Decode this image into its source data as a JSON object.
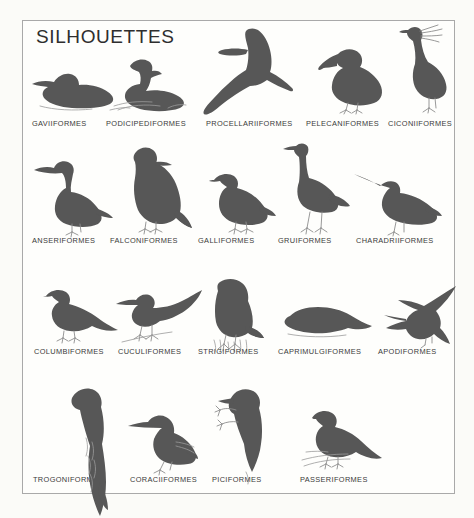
{
  "plate": {
    "title": "SILHOUETTES",
    "border_color": "#a9a9a9",
    "background_color": "#fefefc",
    "silhouette_color": "#575757",
    "label_color": "#3a3a3a"
  },
  "rows": [
    {
      "row_index": 1,
      "items": [
        {
          "label": "GAVIIFORMES",
          "icon": "loon-silhouette",
          "pose": "swimming"
        },
        {
          "label": "PODICIPEDIFORMES",
          "icon": "grebe-silhouette",
          "pose": "swimming-in-water"
        },
        {
          "label": "PROCELLARIIFORMES",
          "icon": "albatross-silhouette",
          "pose": "gliding"
        },
        {
          "label": "PELECANIFORMES",
          "icon": "pelican-silhouette",
          "pose": "standing"
        },
        {
          "label": "CICONIIFORMES",
          "icon": "heron-silhouette",
          "pose": "standing"
        }
      ]
    },
    {
      "row_index": 2,
      "items": [
        {
          "label": "ANSERIFORMES",
          "icon": "goose-silhouette",
          "pose": "standing"
        },
        {
          "label": "FALCONIFORMES",
          "icon": "falcon-silhouette",
          "pose": "perched"
        },
        {
          "label": "GALLIFORMES",
          "icon": "grouse-silhouette",
          "pose": "standing"
        },
        {
          "label": "GRUIFORMES",
          "icon": "crane-silhouette",
          "pose": "standing"
        },
        {
          "label": "CHARADRIIFORMES",
          "icon": "curlew-silhouette",
          "pose": "standing"
        }
      ]
    },
    {
      "row_index": 3,
      "items": [
        {
          "label": "COLUMBIFORMES",
          "icon": "pigeon-silhouette",
          "pose": "perched"
        },
        {
          "label": "CUCULIFORMES",
          "icon": "cuckoo-silhouette",
          "pose": "perched"
        },
        {
          "label": "STRIGIFORMES",
          "icon": "owl-silhouette",
          "pose": "perched"
        },
        {
          "label": "CAPRIMULGIFORMES",
          "icon": "nightjar-silhouette",
          "pose": "roosting"
        },
        {
          "label": "APODIFORMES",
          "icon": "hummingbird-silhouette",
          "pose": "hovering"
        }
      ]
    },
    {
      "row_index": 4,
      "items": [
        {
          "label": "TROGONIFORMES",
          "icon": "trogon-silhouette",
          "pose": "perched-long-tail"
        },
        {
          "label": "CORACIIFORMES",
          "icon": "kingfisher-silhouette",
          "pose": "perched"
        },
        {
          "label": "PICIFORMES",
          "icon": "woodpecker-silhouette",
          "pose": "clinging-to-trunk"
        },
        {
          "label": "PASSERIFORMES",
          "icon": "songbird-silhouette",
          "pose": "perched"
        }
      ]
    }
  ]
}
